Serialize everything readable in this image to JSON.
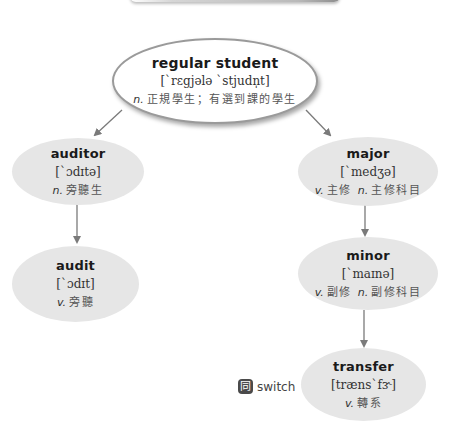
{
  "colors": {
    "root_fill": "#ffffff",
    "root_border": "#9a9a9a",
    "child_fill": "#e6e6e6",
    "connector": "#7a7a7a",
    "term_text": "#1a1a1a",
    "phonetic_text": "#333333",
    "definition_text": "#555555"
  },
  "nodes": {
    "regular_student": {
      "term": "regular student",
      "phonetic": "[ˋrɛgjələ ˋstjudn̩t]",
      "definitions": [
        {
          "pos": "n.",
          "text": "正規學生；有選到課的學生"
        }
      ]
    },
    "auditor": {
      "term": "auditor",
      "phonetic": "[ˋɔdɪtə]",
      "definitions": [
        {
          "pos": "n.",
          "text": "旁聽生"
        }
      ]
    },
    "audit": {
      "term": "audit",
      "phonetic": "[ˋɔdɪt]",
      "definitions": [
        {
          "pos": "v.",
          "text": "旁聽"
        }
      ]
    },
    "major": {
      "term": "major",
      "phonetic": "[ˋmedʒə]",
      "definitions": [
        {
          "pos": "v.",
          "text": "主修"
        },
        {
          "pos": "n.",
          "text": "主修科目"
        }
      ]
    },
    "minor": {
      "term": "minor",
      "phonetic": "[ˋmaɪnə]",
      "definitions": [
        {
          "pos": "v.",
          "text": "副修"
        },
        {
          "pos": "n.",
          "text": "副修科目"
        }
      ]
    },
    "transfer": {
      "term": "transfer",
      "phonetic": "[trænsˋfɝ]",
      "definitions": [
        {
          "pos": "v.",
          "text": "轉系"
        }
      ]
    }
  },
  "synonym": {
    "icon_glyph": "同",
    "icon_name": "synonym-icon",
    "word": "switch"
  },
  "edges": [
    {
      "from": "regular_student",
      "to": "auditor"
    },
    {
      "from": "regular_student",
      "to": "major"
    },
    {
      "from": "auditor",
      "to": "audit"
    },
    {
      "from": "major",
      "to": "minor"
    },
    {
      "from": "minor",
      "to": "transfer"
    }
  ]
}
